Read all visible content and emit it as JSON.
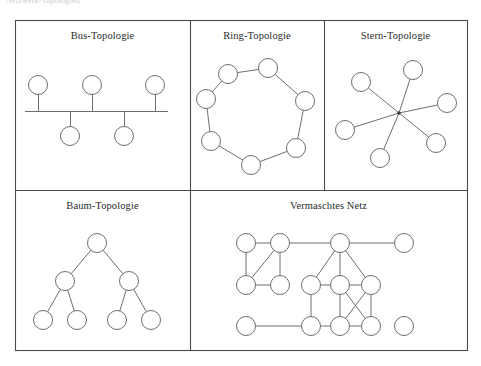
{
  "header": {
    "text": "Netzwerk-Topologien"
  },
  "figure": {
    "frame": {
      "x": 15,
      "y": 20,
      "width": 452,
      "height": 330
    },
    "dividers": {
      "horizontal_y": 190,
      "vertical_top_1_x": 190,
      "vertical_top_2_x": 324,
      "vertical_bottom_x": 190
    },
    "stroke_color": "#6e6e73",
    "frame_color": "#4a4a4f",
    "node_fill": "#ffffff",
    "node_radius": 9.5
  },
  "panels": [
    {
      "id": "bus",
      "title": "Bus-Topologie",
      "type": "bus",
      "nodes": [
        {
          "id": "b1",
          "cx": 38,
          "cy": 85
        },
        {
          "id": "b2",
          "cx": 92,
          "cy": 85
        },
        {
          "id": "b3",
          "cx": 155,
          "cy": 85
        },
        {
          "id": "b4",
          "cx": 70,
          "cy": 136
        },
        {
          "id": "b5",
          "cx": 124,
          "cy": 136
        }
      ],
      "bus_line": {
        "x1": 25,
        "y1": 111,
        "x2": 168,
        "y2": 111
      },
      "edges": [
        {
          "from": "b1",
          "to": "bus"
        },
        {
          "from": "b2",
          "to": "bus"
        },
        {
          "from": "b3",
          "to": "bus"
        },
        {
          "from": "b4",
          "to": "bus"
        },
        {
          "from": "b5",
          "to": "bus"
        }
      ]
    },
    {
      "id": "ring",
      "title": "Ring-Topologie",
      "type": "ring",
      "nodes": [
        {
          "id": "r1",
          "cx": 268,
          "cy": 68
        },
        {
          "id": "r2",
          "cx": 305,
          "cy": 101
        },
        {
          "id": "r3",
          "cx": 296,
          "cy": 148
        },
        {
          "id": "r4",
          "cx": 251,
          "cy": 165
        },
        {
          "id": "r5",
          "cx": 211,
          "cy": 141
        },
        {
          "id": "r6",
          "cx": 206,
          "cy": 99
        },
        {
          "id": "r7",
          "cx": 228,
          "cy": 74
        }
      ],
      "edges": [
        {
          "from": "r1",
          "to": "r2"
        },
        {
          "from": "r2",
          "to": "r3"
        },
        {
          "from": "r3",
          "to": "r4"
        },
        {
          "from": "r4",
          "to": "r5"
        },
        {
          "from": "r5",
          "to": "r6"
        },
        {
          "from": "r6",
          "to": "r7"
        },
        {
          "from": "r7",
          "to": "r1"
        }
      ]
    },
    {
      "id": "star",
      "title": "Stern-Topologie",
      "type": "star",
      "hub": {
        "cx": 399,
        "cy": 113
      },
      "nodes": [
        {
          "id": "s1",
          "cx": 413,
          "cy": 70
        },
        {
          "id": "s2",
          "cx": 361,
          "cy": 82
        },
        {
          "id": "s3",
          "cx": 447,
          "cy": 103
        },
        {
          "id": "s4",
          "cx": 345,
          "cy": 130
        },
        {
          "id": "s5",
          "cx": 436,
          "cy": 143
        },
        {
          "id": "s6",
          "cx": 380,
          "cy": 158
        }
      ],
      "edges": [
        {
          "from": "hub",
          "to": "s1"
        },
        {
          "from": "hub",
          "to": "s2"
        },
        {
          "from": "hub",
          "to": "s3"
        },
        {
          "from": "hub",
          "to": "s4"
        },
        {
          "from": "hub",
          "to": "s5"
        },
        {
          "from": "hub",
          "to": "s6"
        }
      ]
    },
    {
      "id": "tree",
      "title": "Baum-Topologie",
      "type": "tree",
      "nodes": [
        {
          "id": "t0",
          "cx": 97,
          "cy": 243
        },
        {
          "id": "t1",
          "cx": 65,
          "cy": 281
        },
        {
          "id": "t2",
          "cx": 129,
          "cy": 281
        },
        {
          "id": "t3",
          "cx": 43,
          "cy": 320
        },
        {
          "id": "t4",
          "cx": 77,
          "cy": 320
        },
        {
          "id": "t5",
          "cx": 117,
          "cy": 320
        },
        {
          "id": "t6",
          "cx": 151,
          "cy": 320
        }
      ],
      "edges": [
        {
          "from": "t0",
          "to": "t1"
        },
        {
          "from": "t0",
          "to": "t2"
        },
        {
          "from": "t1",
          "to": "t3"
        },
        {
          "from": "t1",
          "to": "t4"
        },
        {
          "from": "t2",
          "to": "t5"
        },
        {
          "from": "t2",
          "to": "t6"
        }
      ]
    },
    {
      "id": "mesh",
      "title": "Vermaschtes Netz",
      "type": "mesh",
      "nodes": [
        {
          "id": "m1",
          "cx": 246,
          "cy": 243
        },
        {
          "id": "m2",
          "cx": 280,
          "cy": 243
        },
        {
          "id": "m3",
          "cx": 340,
          "cy": 243
        },
        {
          "id": "m4",
          "cx": 404,
          "cy": 243
        },
        {
          "id": "m5",
          "cx": 246,
          "cy": 285
        },
        {
          "id": "m6",
          "cx": 280,
          "cy": 285
        },
        {
          "id": "m7",
          "cx": 311,
          "cy": 285
        },
        {
          "id": "m8",
          "cx": 340,
          "cy": 285
        },
        {
          "id": "m9",
          "cx": 371,
          "cy": 285
        },
        {
          "id": "m10",
          "cx": 246,
          "cy": 326
        },
        {
          "id": "m11",
          "cx": 311,
          "cy": 326
        },
        {
          "id": "m12",
          "cx": 340,
          "cy": 326
        },
        {
          "id": "m13",
          "cx": 371,
          "cy": 326
        },
        {
          "id": "m14",
          "cx": 404,
          "cy": 326
        }
      ],
      "edges": [
        {
          "from": "m1",
          "to": "m2"
        },
        {
          "from": "m2",
          "to": "m3"
        },
        {
          "from": "m3",
          "to": "m4"
        },
        {
          "from": "m1",
          "to": "m5"
        },
        {
          "from": "m2",
          "to": "m5"
        },
        {
          "from": "m2",
          "to": "m6"
        },
        {
          "from": "m5",
          "to": "m6"
        },
        {
          "from": "m3",
          "to": "m7"
        },
        {
          "from": "m3",
          "to": "m8"
        },
        {
          "from": "m3",
          "to": "m9"
        },
        {
          "from": "m7",
          "to": "m8"
        },
        {
          "from": "m8",
          "to": "m9"
        },
        {
          "from": "m7",
          "to": "m11"
        },
        {
          "from": "m8",
          "to": "m12"
        },
        {
          "from": "m9",
          "to": "m13"
        },
        {
          "from": "m8",
          "to": "m13"
        },
        {
          "from": "m9",
          "to": "m12"
        },
        {
          "from": "m10",
          "to": "m11"
        },
        {
          "from": "m11",
          "to": "m12"
        },
        {
          "from": "m12",
          "to": "m13"
        }
      ]
    }
  ]
}
